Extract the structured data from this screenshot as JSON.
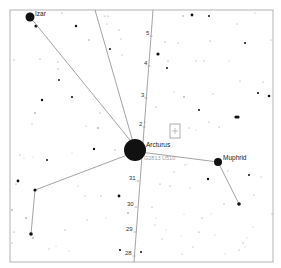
{
  "map": {
    "frame": {
      "x": 10,
      "y": 10,
      "width": 263,
      "height": 252,
      "stroke": "#b4b4b4"
    },
    "colors": {
      "background": "#ffffff",
      "line": "#9a9a9a",
      "star": "#111111",
      "faint_star": "#888888",
      "label": "#222222",
      "designation": "#9aa0aa",
      "marker": "#9a9a9a"
    },
    "named_stars": [
      {
        "name": "Izar",
        "x": 30,
        "y": 17,
        "r": 4.5
      },
      {
        "name": "Arcturus",
        "x": 135,
        "y": 150,
        "r": 11
      },
      {
        "name": "Muphrid",
        "x": 218,
        "y": 162,
        "r": 4
      }
    ],
    "designation": {
      "text": "G2813 U510",
      "x": 144,
      "y": 160
    },
    "constellation_lines": [
      {
        "x1": 30,
        "y1": 17,
        "x2": 134,
        "y2": 145
      },
      {
        "x1": 95,
        "y1": 10,
        "x2": 133,
        "y2": 142
      },
      {
        "x1": 140,
        "y1": 152,
        "x2": 218,
        "y2": 162
      },
      {
        "x1": 130,
        "y1": 154,
        "x2": 35,
        "y2": 190
      },
      {
        "x1": 35,
        "y1": 190,
        "x2": 31,
        "y2": 234
      },
      {
        "x1": 218,
        "y1": 162,
        "x2": 239,
        "y2": 204
      }
    ],
    "path": {
      "label": "trajectory",
      "x1": 153,
      "y1": 10,
      "x2": 134,
      "y2": 262,
      "ticks": [
        {
          "label": "5",
          "x": 151,
          "y": 34
        },
        {
          "label": "4",
          "x": 149,
          "y": 64
        },
        {
          "label": "3",
          "x": 146,
          "y": 96
        },
        {
          "label": "2",
          "x": 144,
          "y": 125
        },
        {
          "label": "31",
          "x": 138,
          "y": 179
        },
        {
          "label": "30",
          "x": 136,
          "y": 205
        },
        {
          "label": "29",
          "x": 135,
          "y": 230
        },
        {
          "label": "28",
          "x": 134,
          "y": 254
        }
      ]
    },
    "target_marker": {
      "x": 170,
      "y": 124,
      "width": 10,
      "height": 14
    },
    "field_stars": [
      [
        36,
        26,
        1.6
      ],
      [
        62,
        13,
        0.6
      ],
      [
        76,
        26,
        1.2
      ],
      [
        89,
        40,
        0.7
      ],
      [
        110,
        49,
        1.0
      ],
      [
        105,
        16,
        0.6
      ],
      [
        14,
        60,
        0.6
      ],
      [
        40,
        59,
        0.6
      ],
      [
        58,
        62,
        0.6
      ],
      [
        58,
        69,
        0.6
      ],
      [
        59,
        80,
        0.9
      ],
      [
        42,
        100,
        1.2
      ],
      [
        72,
        97,
        1.1
      ],
      [
        35,
        113,
        0.8
      ],
      [
        32,
        124,
        0.5
      ],
      [
        100,
        113,
        0.6
      ],
      [
        86,
        126,
        0.5
      ],
      [
        98,
        128,
        0.8
      ],
      [
        108,
        16,
        0.6
      ],
      [
        107,
        24,
        0.5
      ],
      [
        119,
        30,
        0.6
      ],
      [
        121,
        39,
        0.5
      ],
      [
        122,
        55,
        0.5
      ],
      [
        183,
        16,
        0.7
      ],
      [
        192,
        15,
        1.4
      ],
      [
        209,
        16,
        1.0
      ],
      [
        255,
        13,
        0.5
      ],
      [
        237,
        24,
        0.5
      ],
      [
        158,
        54,
        1.6
      ],
      [
        165,
        42,
        0.6
      ],
      [
        178,
        43,
        0.5
      ],
      [
        210,
        41,
        0.6
      ],
      [
        245,
        43,
        1.0
      ],
      [
        271,
        40,
        0.5
      ],
      [
        168,
        61,
        0.6
      ],
      [
        167,
        68,
        1.0
      ],
      [
        204,
        61,
        0.5
      ],
      [
        196,
        61,
        0.5
      ],
      [
        229,
        61,
        0.4
      ],
      [
        240,
        81,
        0.5
      ],
      [
        263,
        82,
        0.5
      ],
      [
        258,
        93,
        1.1
      ],
      [
        269,
        96,
        1.3
      ],
      [
        213,
        94,
        0.5
      ],
      [
        174,
        92,
        0.5
      ],
      [
        184,
        97,
        0.8
      ],
      [
        199,
        110,
        1.0
      ],
      [
        236,
        117,
        1.6
      ],
      [
        238,
        117,
        1.6
      ],
      [
        156,
        107,
        0.6
      ],
      [
        209,
        122,
        0.5
      ],
      [
        219,
        127,
        0.6
      ],
      [
        189,
        128,
        0.5
      ],
      [
        145,
        122,
        0.5
      ],
      [
        20,
        155,
        0.6
      ],
      [
        24,
        158,
        0.4
      ],
      [
        33,
        157,
        0.4
      ],
      [
        47,
        160,
        1.0
      ],
      [
        94,
        149,
        1.2
      ],
      [
        115,
        150,
        0.6
      ],
      [
        125,
        154,
        0.5
      ],
      [
        72,
        153,
        0.4
      ],
      [
        18,
        181,
        1.4
      ],
      [
        16,
        184,
        0.6
      ],
      [
        78,
        186,
        0.5
      ],
      [
        85,
        196,
        0.5
      ],
      [
        101,
        196,
        0.6
      ],
      [
        119,
        196,
        1.4
      ],
      [
        12,
        210,
        0.8
      ],
      [
        26,
        218,
        0.8
      ],
      [
        87,
        220,
        0.5
      ],
      [
        106,
        218,
        0.4
      ],
      [
        128,
        213,
        0.8
      ],
      [
        14,
        232,
        0.6
      ],
      [
        12,
        243,
        0.5
      ],
      [
        33,
        238,
        0.8
      ],
      [
        49,
        249,
        0.5
      ],
      [
        56,
        246,
        0.4
      ],
      [
        69,
        251,
        0.4
      ],
      [
        65,
        230,
        0.6
      ],
      [
        120,
        250,
        1.1
      ],
      [
        141,
        252,
        1.0
      ],
      [
        182,
        254,
        0.5
      ],
      [
        193,
        247,
        0.5
      ],
      [
        225,
        254,
        0.4
      ],
      [
        239,
        250,
        0.5
      ],
      [
        243,
        243,
        0.6
      ],
      [
        245,
        247,
        0.4
      ],
      [
        247,
        238,
        0.4
      ],
      [
        185,
        165,
        0.5
      ],
      [
        174,
        172,
        0.6
      ],
      [
        160,
        184,
        0.6
      ],
      [
        170,
        186,
        0.6
      ],
      [
        190,
        188,
        0.5
      ],
      [
        208,
        179,
        1.2
      ],
      [
        249,
        175,
        1.0
      ],
      [
        261,
        177,
        0.5
      ],
      [
        254,
        195,
        0.5
      ],
      [
        272,
        214,
        0.5
      ],
      [
        224,
        204,
        0.6
      ],
      [
        211,
        214,
        0.4
      ],
      [
        202,
        218,
        0.6
      ],
      [
        199,
        232,
        0.6
      ],
      [
        184,
        214,
        0.4
      ],
      [
        152,
        207,
        0.6
      ],
      [
        156,
        218,
        0.4
      ],
      [
        155,
        225,
        0.5
      ],
      [
        166,
        230,
        0.4
      ],
      [
        162,
        239,
        0.5
      ],
      [
        181,
        236,
        0.4
      ],
      [
        215,
        235,
        0.4
      ],
      [
        253,
        227,
        0.4
      ],
      [
        228,
        171,
        0.5
      ],
      [
        242,
        158,
        0.4
      ],
      [
        196,
        130,
        0.4
      ],
      [
        151,
        144,
        0.4
      ],
      [
        187,
        164,
        0.4
      ]
    ]
  }
}
